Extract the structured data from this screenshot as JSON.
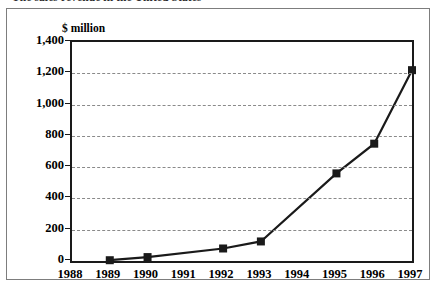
{
  "caption": {
    "text": "The sales revenue in the United States"
  },
  "chart_data": {
    "type": "line",
    "title": "The sales revenue in the United States",
    "unit_label": "$ million",
    "xlabel": "",
    "ylabel": "$ million",
    "x": [
      1988,
      1989,
      1990,
      1991,
      1992,
      1993,
      1994,
      1995,
      1996,
      1997
    ],
    "categories": [
      "1988",
      "1989",
      "1990",
      "1991",
      "1992",
      "1993",
      "1994",
      "1995",
      "1996",
      "1997"
    ],
    "series": [
      {
        "name": "Sales revenue",
        "values": [
          null,
          5,
          25,
          null,
          80,
          125,
          null,
          560,
          750,
          1220
        ],
        "marker_years": [
          1989,
          1990,
          1992,
          1993,
          1995,
          1996,
          1997
        ],
        "color": "#1a1a1a",
        "marker": "square"
      }
    ],
    "ylim": [
      0,
      1400
    ],
    "yticks": [
      0,
      200,
      400,
      600,
      800,
      1000,
      1200,
      1400
    ],
    "ytick_labels": [
      "0",
      "200",
      "400",
      "600",
      "800",
      "1,000",
      "1,200",
      "1,400"
    ],
    "xtick_labels": [
      "1988",
      "1989",
      "1990",
      "1991",
      "1992",
      "1993",
      "1994",
      "1995",
      "1996",
      "1997"
    ],
    "grid": "horizontal-dashed",
    "legend": "none",
    "line_color": "#1a1a1a",
    "grid_color": "#8a8a8a",
    "frame_color": "#7d7d7d",
    "axis_color": "#1a1a1a"
  }
}
